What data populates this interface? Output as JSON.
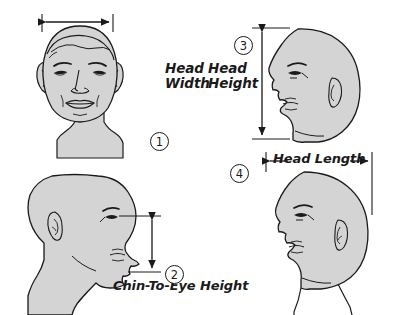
{
  "diagram": {
    "background_color": "#ffffff",
    "skin_fill_color": "#d4d4d4",
    "line_color": "#1a1a1a"
  },
  "measurements": [
    {
      "number": "1",
      "label": "Head Width",
      "label_line_1": "Head",
      "label_line_2": "Width",
      "view": "frontal-face",
      "arrow": "horizontal-double",
      "position": "top-left"
    },
    {
      "number": "2",
      "label": "Chin-To-Eye Height",
      "view": "profile-facing-right",
      "arrow": "vertical-double",
      "position": "bottom-left"
    },
    {
      "number": "3",
      "label": "Head Height",
      "label_line_1": "Head",
      "label_line_2": "Height",
      "view": "profile-facing-left",
      "arrow": "vertical-double",
      "position": "top-right"
    },
    {
      "number": "4",
      "label": "Head Length",
      "view": "profile-facing-left",
      "arrow": "horizontal-double",
      "position": "bottom-right"
    }
  ]
}
